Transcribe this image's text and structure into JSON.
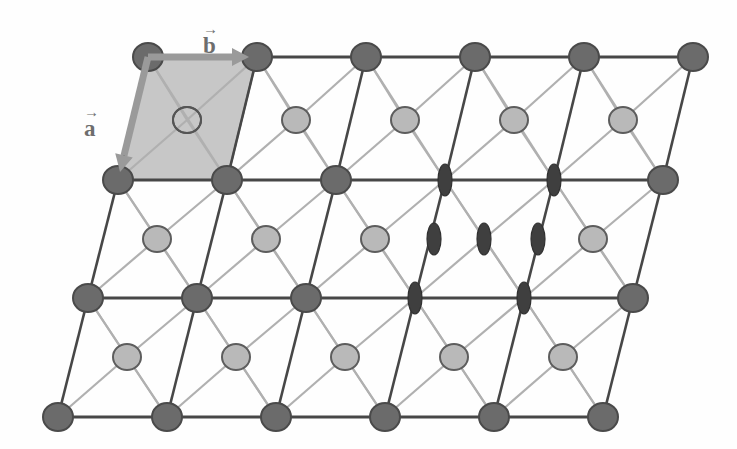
{
  "figure": {
    "name": "crystal-lattice-unit-cell-diagram",
    "background_color": "#fefefe",
    "width": 737,
    "height": 449
  },
  "colors": {
    "lattice_node_fill": "#6b6b6b",
    "lattice_node_stroke": "#4a4a4a",
    "interstitial_fill": "#b9b9b9",
    "interstitial_stroke": "#5d5d5d",
    "ellipse_fill": "#3f3f3f",
    "ellipse_stroke": "#303030",
    "unit_cell_fill": "#c7c7c7",
    "unit_cell_stroke": "#8a8a8a",
    "bond_dark": "#474747",
    "bond_light": "#b0b0b0",
    "arrow_color": "#9a9a9a",
    "label_color": "#6d6d6d"
  },
  "geometry": {
    "row_dx": -30,
    "row_dy": 57,
    "col_dx": 109,
    "origin_x": 148,
    "origin_y": 57,
    "node_rx": 15,
    "node_ry": 14,
    "interstitial_rx": 14,
    "interstitial_ry": 13,
    "ellipse_rx": 7,
    "ellipse_ry": 16
  },
  "labels": {
    "vector_a": {
      "text": "a",
      "accent": "→",
      "x": 84,
      "y": 108
    },
    "vector_b": {
      "text": "b",
      "accent": "→",
      "x": 203,
      "y": 25
    }
  },
  "unit_cell": {
    "label": "unit-cell",
    "corners": [
      [
        148,
        57
      ],
      [
        257,
        57
      ],
      [
        227,
        180
      ],
      [
        118,
        180
      ]
    ],
    "center_circle": {
      "x": 187,
      "y": 120,
      "rx": 15,
      "ry": 14
    }
  },
  "arrows": {
    "a_vector": {
      "x1": 148,
      "y1": 57,
      "x2": 120,
      "y2": 172
    },
    "b_vector": {
      "x1": 148,
      "y1": 57,
      "x2": 249,
      "y2": 57
    }
  },
  "lattice_rows": [
    {
      "index": 0,
      "y": 57,
      "sites": [
        {
          "col": 0,
          "x": 148,
          "type": "node"
        },
        {
          "col": 1,
          "x": 257,
          "type": "node"
        },
        {
          "col": 2,
          "x": 366,
          "type": "node"
        },
        {
          "col": 3,
          "x": 475,
          "type": "node"
        },
        {
          "col": 4,
          "x": 584,
          "type": "node"
        },
        {
          "col": 5,
          "x": 693,
          "type": "node"
        }
      ]
    },
    {
      "index": 1,
      "y": 180,
      "sites": [
        {
          "col": 0,
          "x": 118,
          "type": "node"
        },
        {
          "col": 1,
          "x": 227,
          "type": "node"
        },
        {
          "col": 2,
          "x": 336,
          "type": "node"
        },
        {
          "col": 3,
          "x": 445,
          "type": "ellipse"
        },
        {
          "col": 4,
          "x": 554,
          "type": "ellipse"
        },
        {
          "col": 5,
          "x": 663,
          "type": "node"
        }
      ]
    },
    {
      "index": 2,
      "y": 298,
      "sites": [
        {
          "col": 0,
          "x": 88,
          "type": "node"
        },
        {
          "col": 1,
          "x": 197,
          "type": "node"
        },
        {
          "col": 2,
          "x": 306,
          "type": "node"
        },
        {
          "col": 3,
          "x": 415,
          "type": "ellipse"
        },
        {
          "col": 4,
          "x": 524,
          "type": "ellipse"
        },
        {
          "col": 5,
          "x": 633,
          "type": "node"
        }
      ]
    },
    {
      "index": 3,
      "y": 417,
      "sites": [
        {
          "col": 0,
          "x": 58,
          "type": "node"
        },
        {
          "col": 1,
          "x": 167,
          "type": "node"
        },
        {
          "col": 2,
          "x": 276,
          "type": "node"
        },
        {
          "col": 3,
          "x": 385,
          "type": "node"
        },
        {
          "col": 4,
          "x": 494,
          "type": "node"
        },
        {
          "col": 5,
          "x": 603,
          "type": "node"
        }
      ]
    }
  ],
  "interstitial_rows": [
    {
      "index": 0,
      "y": 120,
      "sites": [
        {
          "col": 0,
          "x": 187,
          "type": "open"
        },
        {
          "col": 1,
          "x": 296,
          "type": "filled"
        },
        {
          "col": 2,
          "x": 405,
          "type": "filled"
        },
        {
          "col": 3,
          "x": 514,
          "type": "filled"
        },
        {
          "col": 4,
          "x": 623,
          "type": "filled"
        }
      ]
    },
    {
      "index": 1,
      "y": 239,
      "sites": [
        {
          "col": 0,
          "x": 157,
          "type": "filled"
        },
        {
          "col": 1,
          "x": 266,
          "type": "filled"
        },
        {
          "col": 2,
          "x": 375,
          "type": "filled"
        },
        {
          "col": 3,
          "x": 484,
          "type": "ellipse"
        },
        {
          "col": 4,
          "x": 593,
          "type": "filled"
        }
      ]
    },
    {
      "index": 2,
      "y": 357,
      "sites": [
        {
          "col": 0,
          "x": 127,
          "type": "filled"
        },
        {
          "col": 1,
          "x": 236,
          "type": "filled"
        },
        {
          "col": 2,
          "x": 345,
          "type": "filled"
        },
        {
          "col": 3,
          "x": 454,
          "type": "filled"
        },
        {
          "col": 4,
          "x": 563,
          "type": "filled"
        }
      ]
    }
  ],
  "extra_ellipses": [
    {
      "x": 434,
      "y": 239,
      "label": "ellipse-mid-left"
    },
    {
      "x": 538,
      "y": 239,
      "label": "ellipse-mid-right"
    }
  ]
}
